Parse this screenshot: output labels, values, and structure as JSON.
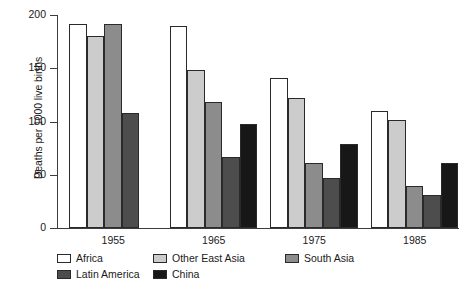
{
  "chart_data": {
    "type": "bar",
    "title": "",
    "xlabel": "",
    "ylabel": "Deaths per 1000 live births",
    "ylim": [
      0,
      200
    ],
    "yticks": [
      0,
      50,
      100,
      150,
      200
    ],
    "grid": false,
    "legend_position": "bottom-left",
    "categories": [
      "1955",
      "1965",
      "1975",
      "1985"
    ],
    "series": [
      {
        "name": "Africa",
        "color": "#ffffff",
        "values": [
          192,
          190,
          141,
          110
        ]
      },
      {
        "name": "Other East Asia",
        "color": "#cccccc",
        "values": [
          180,
          148,
          122,
          101
        ]
      },
      {
        "name": "South Asia",
        "color": "#8c8c8c",
        "values": [
          192,
          118,
          61,
          39
        ]
      },
      {
        "name": "Latin America",
        "color": "#4d4d4d",
        "values": [
          108,
          67,
          47,
          31
        ]
      },
      {
        "name": "China",
        "color": "#171717",
        "values": [
          121,
          98,
          79,
          61
        ]
      }
    ],
    "note_series_offsets": {
      "1955": [
        "Africa",
        "Other East Asia",
        "South Asia",
        "Latin America"
      ]
    }
  },
  "legend": {
    "row1": [
      "Africa",
      "Other East Asia",
      "South Asia"
    ],
    "row2": [
      "Latin America",
      "China"
    ]
  }
}
